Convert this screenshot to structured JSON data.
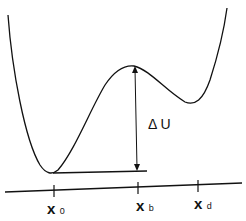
{
  "diagram": {
    "type": "potential energy curve with barrier",
    "delta_label": "Δ U",
    "axis_labels": [
      {
        "main": "x",
        "sub": "0"
      },
      {
        "main": "x",
        "sub": "b"
      },
      {
        "main": "x",
        "sub": "d"
      }
    ],
    "colors": {
      "line": "#111111",
      "background": "#ffffff"
    }
  }
}
